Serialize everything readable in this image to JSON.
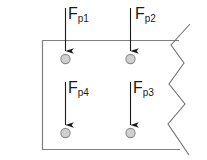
{
  "diagram": {
    "type": "free-body-diagram",
    "canvas": {
      "width": 207,
      "height": 160,
      "background": "#ffffff"
    },
    "colors": {
      "outline": "#808080",
      "arrow": "#1a1a1a",
      "label": "#1a1a1a",
      "node_fill": "#d0d0d0",
      "node_stroke": "#8c8c8c",
      "break_line": "#707070"
    },
    "plate": {
      "name": "plate-body",
      "left": 42,
      "top": 40,
      "right": 178,
      "bottom": 150,
      "stroke_width": 1.2,
      "right_edge_style": "zigzag-break"
    },
    "break_line": {
      "name": "zigzag-break-line",
      "points": "190,24 171,45 184,63 169,84 185,104 168,124 189,155",
      "meaning": "section break / continues to the right"
    },
    "forces": [
      {
        "id": "Fp1",
        "label_base": "F",
        "label_sub": "p1",
        "label_x": 68,
        "label_y": 6,
        "arrow_x": 65,
        "arrow_y_start": 8,
        "arrow_y_end": 51,
        "direction": "down",
        "node_cx": 65,
        "node_cy": 59,
        "node_r": 5,
        "row": "top",
        "column": "left"
      },
      {
        "id": "Fp2",
        "label_base": "F",
        "label_sub": "p2",
        "label_x": 135,
        "label_y": 6,
        "arrow_x": 130,
        "arrow_y_start": 8,
        "arrow_y_end": 51,
        "direction": "down",
        "node_cx": 130,
        "node_cy": 59,
        "node_r": 5,
        "row": "top",
        "column": "right"
      },
      {
        "id": "Fp4",
        "label_base": "F",
        "label_sub": "p4",
        "label_x": 68,
        "label_y": 80,
        "arrow_x": 65,
        "arrow_y_start": 82,
        "arrow_y_end": 125,
        "direction": "down",
        "node_cx": 65,
        "node_cy": 133,
        "node_r": 5,
        "row": "bottom",
        "column": "left"
      },
      {
        "id": "Fp3",
        "label_base": "F",
        "label_sub": "p3",
        "label_x": 133,
        "label_y": 80,
        "arrow_x": 130,
        "arrow_y_start": 82,
        "arrow_y_end": 125,
        "direction": "down",
        "node_cx": 130,
        "node_cy": 133,
        "node_r": 5,
        "row": "bottom",
        "column": "right"
      }
    ]
  }
}
